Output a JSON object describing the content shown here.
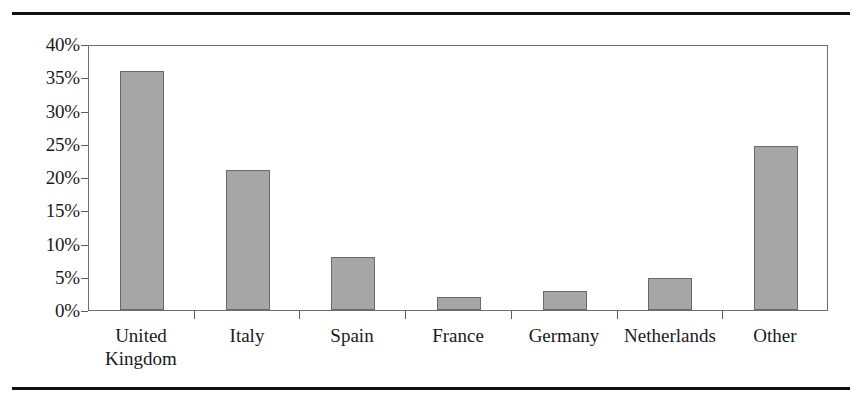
{
  "figure": {
    "top_rule": "",
    "bottom_rule": ""
  },
  "chart_data": {
    "type": "bar",
    "title": "",
    "xlabel": "",
    "ylabel": "",
    "categories": [
      "United\nKingdom",
      "Italy",
      "Spain",
      "France",
      "Germany",
      "Netherlands",
      "Other"
    ],
    "values": [
      36.0,
      21.0,
      8.0,
      2.0,
      2.8,
      4.8,
      24.7
    ],
    "ylim": [
      0,
      40
    ],
    "ytick_values": [
      0,
      5,
      10,
      15,
      20,
      25,
      30,
      35,
      40
    ],
    "ytick_labels": [
      "0%",
      "5%",
      "10%",
      "15%",
      "20%",
      "25%",
      "30%",
      "35%",
      "40%"
    ],
    "grid": false,
    "legend": null,
    "bar_color": "#a6a6a6",
    "bar_edge_color": "#6a6a6a",
    "axis_color": "#6e6e6e",
    "value_format": "percent"
  }
}
